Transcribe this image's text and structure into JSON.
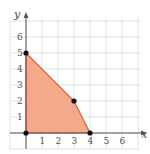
{
  "chart_data": {
    "type": "area",
    "title": "",
    "xlabel": "x",
    "ylabel": "y",
    "xlim": [
      -1,
      7
    ],
    "ylim": [
      -1,
      7
    ],
    "grid": true,
    "x_ticks": [
      "1",
      "2",
      "3",
      "4",
      "5",
      "6"
    ],
    "y_ticks": [
      "1",
      "2",
      "3",
      "4",
      "5",
      "6"
    ],
    "region": {
      "name": "feasible region",
      "vertices": [
        [
          0,
          0
        ],
        [
          0,
          5
        ],
        [
          3,
          2
        ],
        [
          4,
          0
        ]
      ],
      "fill": "#f4a98a",
      "stroke": "#e0603a"
    },
    "points": [
      [
        0,
        0
      ],
      [
        0,
        5
      ],
      [
        3,
        2
      ],
      [
        4,
        0
      ]
    ],
    "colors": {
      "grid": "#d9d9d9",
      "axis": "#555555",
      "point": "#111111"
    }
  }
}
